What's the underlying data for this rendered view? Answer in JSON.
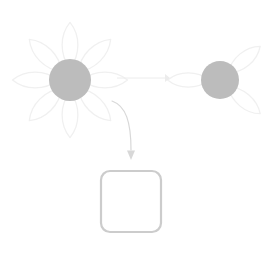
{
  "canvas": {
    "width": 275,
    "height": 271,
    "background": "#ffffff",
    "title": "flower petal removal diagram"
  },
  "palette": {
    "petal_outline": "#f0f0f0",
    "petal_fill": "#ffffff",
    "flower_center": "#bcbcbc",
    "arrow_light": "#ececec",
    "arrow_dark": "#d8d8d8",
    "box_border": "#cccccc",
    "box_fill": "#ffffff"
  },
  "source_flower": {
    "name": "eight-petal-flower",
    "center_x": 70,
    "center_y": 80,
    "center_radius": 21,
    "petal_count": 8,
    "petal_length": 46,
    "petal_width": 21,
    "petal_angles": [
      0,
      45,
      90,
      135,
      180,
      225,
      270,
      315
    ]
  },
  "result_flower": {
    "name": "three-petal-flower",
    "center_x": 220,
    "center_y": 80,
    "center_radius": 19,
    "petal_count": 3,
    "petal_length": 42,
    "petal_width": 19,
    "petal_angles": [
      50,
      130,
      270
    ]
  },
  "straight_arrow": {
    "name": "transform-arrow",
    "x1": 117,
    "y1": 78,
    "x2": 170,
    "y2": 78,
    "stroke_width": 1,
    "head_size": 5,
    "color": "#ececec"
  },
  "curved_arrow": {
    "name": "drag-arrow",
    "path": "M 112 101 C 126 106, 131 122, 131 150",
    "tip_x": 131,
    "tip_y": 160,
    "stroke_width": 1.2,
    "head_size": 5,
    "color": "#d8d8d8"
  },
  "drop_box": {
    "name": "empty-drop-box",
    "x": 101,
    "y": 171,
    "width": 60,
    "height": 61,
    "corner_radius": 9,
    "border_width": 2.2,
    "border_color": "#cccccc",
    "fill": "#ffffff",
    "label": ""
  }
}
